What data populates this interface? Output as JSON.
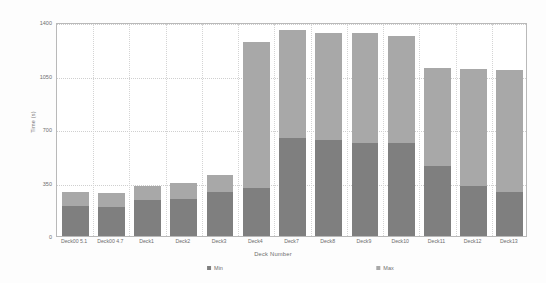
{
  "chart_data": {
    "type": "bar",
    "title": "",
    "xlabel": "Deck Number",
    "ylabel": "Time (s)",
    "ylim": [
      0,
      1400
    ],
    "yticks": [
      0,
      350,
      700,
      1050,
      1400
    ],
    "ytick_labels": [
      "0",
      "350",
      "700",
      "1050",
      "1400"
    ],
    "grid": true,
    "legend_position": "bottom",
    "categories": [
      "Deck00 5.1",
      "Deck00 4.7",
      "Deck1",
      "Deck2",
      "Deck3",
      "Deck4",
      "Deck7",
      "Deck8",
      "Deck9",
      "Deck10",
      "Deck11",
      "Deck12",
      "Deck13"
    ],
    "series": [
      {
        "name": "Max",
        "color": "#a8a8a8",
        "values": [
          285,
          280,
          325,
          345,
          400,
          1270,
          1350,
          1330,
          1330,
          1310,
          1100,
          1095,
          1085
        ]
      },
      {
        "name": "Min",
        "color": "#7f7f7f",
        "values": [
          195,
          190,
          235,
          245,
          290,
          315,
          640,
          625,
          610,
          610,
          455,
          325,
          290
        ]
      }
    ]
  },
  "legend": {
    "entries": [
      {
        "label": "Min",
        "color": "#7f7f7f"
      },
      {
        "label": "Max",
        "color": "#a8a8a8"
      }
    ]
  },
  "axes": {
    "y_title": "Time (s)",
    "x_title": "Deck Number"
  },
  "colors": {
    "plot_border": "#b9b9b9",
    "grid": "#cfcfcf",
    "text": "#6e6e6e",
    "background": "#fdfdfd"
  }
}
